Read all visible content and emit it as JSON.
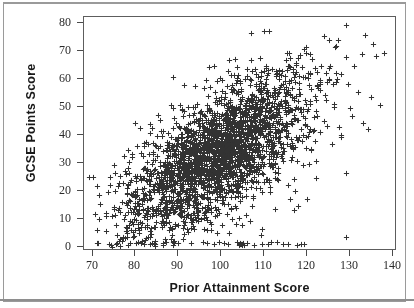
{
  "chart_data": {
    "type": "scatter",
    "title": "",
    "xlabel": "Prior Attainment Score",
    "ylabel": "GCSE Points Score",
    "xlim": [
      68,
      141
    ],
    "ylim": [
      -1.5,
      82
    ],
    "xticks": [
      70,
      80,
      90,
      100,
      110,
      120,
      130,
      140
    ],
    "yticks": [
      0,
      10,
      20,
      30,
      40,
      50,
      60,
      70,
      80
    ],
    "xtick_labels": [
      "70",
      "80",
      "90",
      "100",
      "110",
      "120",
      "130",
      "140"
    ],
    "ytick_labels": [
      "0",
      "10",
      "20",
      "30",
      "40",
      "50",
      "60",
      "70",
      "80"
    ],
    "grid": false,
    "legend": null,
    "marker": "plus",
    "marker_color": "#333333",
    "frame": "box",
    "tick_direction": "out",
    "n_points": 2600,
    "correlation": 0.68,
    "distribution": {
      "x_mean": 99.5,
      "x_sd": 10.5,
      "y_intercept": -54,
      "y_slope": 0.88,
      "y_residual_sd": 10.5,
      "y_floor": 0,
      "y_ceiling": 80
    },
    "annotations": []
  },
  "axes": {
    "x": {
      "label": "Prior Attainment Score",
      "ticks": [
        "70",
        "80",
        "90",
        "100",
        "110",
        "120",
        "130",
        "140"
      ]
    },
    "y": {
      "label": "GCSE Points Score",
      "ticks": [
        "0",
        "10",
        "20",
        "30",
        "40",
        "50",
        "60",
        "70",
        "80"
      ]
    }
  }
}
